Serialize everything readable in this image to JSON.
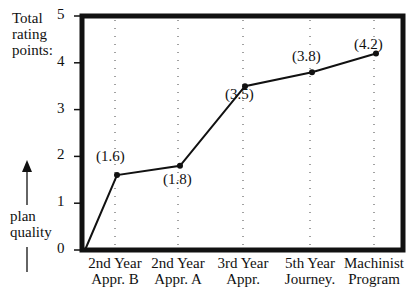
{
  "chart_data": {
    "type": "line",
    "title": "",
    "ylabel_top": [
      "Total",
      "rating",
      "points:"
    ],
    "ylabel_bottom": [
      "plan",
      "quality"
    ],
    "xlabel": "",
    "ylim": [
      0,
      5
    ],
    "yticks": [
      "0",
      "1",
      "2",
      "3",
      "4",
      "5"
    ],
    "categories": [
      [
        "2nd Year",
        "Appr. B"
      ],
      [
        "2nd Year",
        "Appr. A"
      ],
      [
        "3rd Year",
        "Appr."
      ],
      [
        "5th Year",
        "Journey."
      ],
      [
        "Machinist",
        "Program"
      ]
    ],
    "start_point": 0,
    "values": [
      1.6,
      1.8,
      3.5,
      3.8,
      4.2
    ],
    "data_labels": [
      "(1.6)",
      "(1.8)",
      "(3.5)",
      "(3.8)",
      "(4.2)"
    ],
    "grid": "vertical dotted lines at each category",
    "legend": "none"
  }
}
